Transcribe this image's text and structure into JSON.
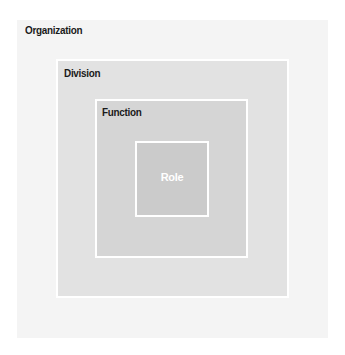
{
  "diagram": {
    "type": "nested-boxes",
    "levels": [
      {
        "label": "Organization",
        "fill": "#f4f4f4",
        "text_color": "#1a1a1a"
      },
      {
        "label": "Division",
        "fill": "#e2e2e2",
        "text_color": "#1a1a1a"
      },
      {
        "label": "Function",
        "fill": "#d5d5d5",
        "text_color": "#1a1a1a"
      },
      {
        "label": "Role",
        "fill": "#cbcbcb",
        "text_color": "#ffffff"
      }
    ],
    "border_color": "#ffffff"
  }
}
